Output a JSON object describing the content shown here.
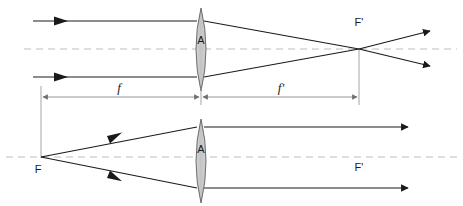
{
  "figure": {
    "width": 463,
    "height": 206,
    "background_color": "#ffffff",
    "colors": {
      "ray": "#1a1a1a",
      "lens_fill": "#c9c9c9",
      "lens_stroke": "#555555",
      "axis_dash": "#bdbdbd",
      "dimension": "#8a8a8a",
      "text": "#1a1a1a"
    }
  },
  "top_diagram": {
    "name": "parallel-rays-converge-to-focal-point",
    "lens_label": "A",
    "focal_point_label": "F'",
    "axis": {
      "y": 49,
      "x_start": 24,
      "x_end": 457,
      "style": "dashed"
    },
    "lens": {
      "cx": 201,
      "top_y": 8,
      "bottom_y": 91,
      "half_width": 10
    },
    "incoming_rays": [
      {
        "name": "upper-parallel-ray",
        "x1": 33,
        "y1": 21,
        "x2": 197,
        "y2": 21,
        "arrow_at_x": 62
      },
      {
        "name": "lower-parallel-ray",
        "x1": 33,
        "y1": 77,
        "x2": 197,
        "y2": 77,
        "arrow_at_x": 62
      }
    ],
    "converging_rays": [
      {
        "name": "upper-converging-ray",
        "x1": 205,
        "y1": 21,
        "x2": 359,
        "y2": 49
      },
      {
        "name": "lower-converging-ray",
        "x1": 205,
        "y1": 77,
        "x2": 359,
        "y2": 49
      }
    ],
    "diverging_rays": [
      {
        "name": "upper-diverging-ray",
        "x1": 359,
        "y1": 49,
        "x2": 432,
        "y2": 31
      },
      {
        "name": "lower-diverging-ray",
        "x1": 359,
        "y1": 49,
        "x2": 432,
        "y2": 65
      }
    ],
    "focal_point": {
      "x": 359,
      "y": 49,
      "label_x": 359,
      "label_y": 26
    }
  },
  "dimensions": {
    "name": "focal-length-dimension-row",
    "y": 97,
    "left_tick_x": 41,
    "center_tick_x": 201,
    "right_tick_x": 359,
    "segments": [
      {
        "name": "object-side-focal-length",
        "label": "f",
        "label_x": 119,
        "label_y": 91
      },
      {
        "name": "image-side-focal-length",
        "label": "f'",
        "label_x": 280,
        "label_y": 91
      }
    ],
    "extension_lines": [
      {
        "name": "left-extension-line",
        "x": 41,
        "y1": 86,
        "y2": 158
      },
      {
        "name": "center-extension-line",
        "x": 201,
        "y1": 86,
        "y2": 104
      },
      {
        "name": "right-extension-line",
        "x": 359,
        "y1": 50,
        "y2": 104
      }
    ]
  },
  "bottom_diagram": {
    "name": "rays-from-focal-point-exit-parallel",
    "lens_label": "A",
    "object_focal_label": "F",
    "image_focal_label": "F'",
    "axis": {
      "y": 157,
      "x_start": 6,
      "x_end": 457,
      "style": "dashed"
    },
    "lens": {
      "cx": 201,
      "top_y": 119,
      "bottom_y": 203,
      "half_width": 10
    },
    "diverging_rays": [
      {
        "name": "upper-ray-from-focus",
        "x1": 41,
        "y1": 157,
        "x2": 197,
        "y2": 127,
        "arrow_at_x": 118
      },
      {
        "name": "lower-ray-from-focus",
        "x1": 41,
        "y1": 157,
        "x2": 197,
        "y2": 188,
        "arrow_at_x": 118
      }
    ],
    "outgoing_rays": [
      {
        "name": "upper-parallel-exit-ray",
        "x1": 205,
        "y1": 127,
        "x2": 410,
        "y2": 127
      },
      {
        "name": "lower-parallel-exit-ray",
        "x1": 205,
        "y1": 188,
        "x2": 410,
        "y2": 188
      }
    ],
    "focal_points": [
      {
        "name": "object-focal-point",
        "label": "F",
        "x": 41,
        "y": 157,
        "label_x": 38,
        "label_y": 172
      },
      {
        "name": "image-focal-point",
        "label": "F'",
        "x": 359,
        "y": 157,
        "label_x": 359,
        "label_y": 170
      }
    ]
  }
}
